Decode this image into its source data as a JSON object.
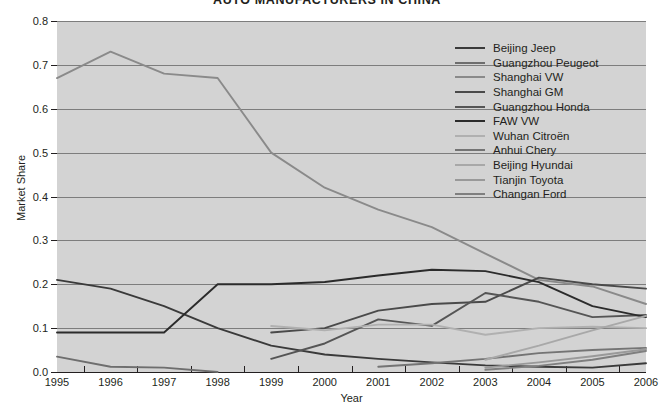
{
  "chart_data": {
    "type": "line",
    "title": "AUTO MANUFACTURERS IN CHINA",
    "xlabel": "Year",
    "ylabel": "Market Share",
    "x": [
      1995,
      1996,
      1997,
      1998,
      1999,
      2000,
      2001,
      2002,
      2003,
      2004,
      2005,
      2006
    ],
    "xtick_labels": [
      "1995",
      "1996",
      "1997",
      "1998",
      "1999",
      "2000",
      "2001",
      "2002",
      "2003",
      "2004",
      "2005",
      "2006"
    ],
    "ytick_labels": [
      "0.0",
      "0.1",
      "0.2",
      "0.3",
      "0.4",
      "0.5",
      "0.6",
      "0.7",
      "0.8"
    ],
    "ytick_values": [
      0.0,
      0.1,
      0.2,
      0.3,
      0.4,
      0.5,
      0.6,
      0.7,
      0.8
    ],
    "ylim": [
      0.0,
      0.8
    ],
    "xlim": [
      1995,
      2006
    ],
    "grid": true,
    "legend_position": "upper-right",
    "series": [
      {
        "name": "Beijing Jeep",
        "color": "#3a3a3a",
        "x": [
          1995,
          1996,
          1997,
          1998,
          1999,
          2000,
          2001,
          2002,
          2003,
          2004,
          2005,
          2006
        ],
        "values": [
          0.21,
          0.19,
          0.15,
          0.1,
          0.06,
          0.04,
          0.03,
          0.022,
          0.015,
          0.012,
          0.01,
          0.02
        ]
      },
      {
        "name": "Guangzhou Peugeot",
        "color": "#6e6e6e",
        "x": [
          1995,
          1996,
          1997,
          1998,
          1999
        ],
        "values": [
          0.035,
          0.012,
          0.01,
          0.0,
          null
        ]
      },
      {
        "name": "Shanghai VW",
        "color": "#8a8a8a",
        "x": [
          1995,
          1996,
          1997,
          1998,
          1999,
          2000,
          2001,
          2002,
          2003,
          2004,
          2005,
          2006
        ],
        "values": [
          0.67,
          0.73,
          0.68,
          0.67,
          0.5,
          0.42,
          0.37,
          0.33,
          0.27,
          0.21,
          0.195,
          0.155
        ]
      },
      {
        "name": "Shanghai GM",
        "color": "#4a4a4a",
        "x": [
          1999,
          2000,
          2001,
          2002,
          2003,
          2004,
          2005,
          2006
        ],
        "values": [
          0.09,
          0.1,
          0.14,
          0.155,
          0.16,
          0.215,
          0.2,
          0.19
        ]
      },
      {
        "name": "Guangzhou Honda",
        "color": "#555555",
        "x": [
          1999,
          2000,
          2001,
          2002,
          2003,
          2004,
          2005,
          2006
        ],
        "values": [
          0.03,
          0.065,
          0.12,
          0.105,
          0.18,
          0.16,
          0.125,
          0.13
        ]
      },
      {
        "name": "FAW VW",
        "color": "#2b2b2b",
        "x": [
          1995,
          1996,
          1997,
          1998,
          1999,
          2000,
          2001,
          2002,
          2003,
          2004,
          2005,
          2006
        ],
        "values": [
          0.09,
          0.09,
          0.09,
          0.2,
          0.2,
          0.205,
          0.22,
          0.233,
          0.23,
          0.205,
          0.15,
          0.125
        ]
      },
      {
        "name": "Wuhan Citroën",
        "color": "#b0b0b0",
        "x": [
          1999,
          2000,
          2001,
          2002,
          2003,
          2004,
          2005,
          2006
        ],
        "values": [
          0.105,
          0.095,
          0.108,
          0.108,
          0.085,
          0.1,
          0.103,
          0.1
        ]
      },
      {
        "name": "Anhui Chery",
        "color": "#747474",
        "x": [
          2001,
          2002,
          2003,
          2004,
          2005,
          2006
        ],
        "values": [
          0.012,
          0.02,
          0.03,
          0.043,
          0.05,
          0.055
        ]
      },
      {
        "name": "Beijing Hyundai",
        "color": "#a8a8a8",
        "x": [
          2003,
          2004,
          2005,
          2006
        ],
        "values": [
          0.028,
          0.06,
          0.095,
          0.128
        ]
      },
      {
        "name": "Tianjin Toyota",
        "color": "#999999",
        "x": [
          2003,
          2004,
          2005,
          2006
        ],
        "values": [
          0.01,
          0.022,
          0.036,
          0.052
        ]
      },
      {
        "name": "Changan Ford",
        "color": "#7f7f7f",
        "x": [
          2003,
          2004,
          2005,
          2006
        ],
        "values": [
          0.005,
          0.014,
          0.028,
          0.048
        ]
      }
    ]
  },
  "legend": {
    "items": [
      {
        "label": "Beijing Jeep",
        "color": "#3a3a3a"
      },
      {
        "label": "Guangzhou Peugeot",
        "color": "#6e6e6e"
      },
      {
        "label": "Shanghai VW",
        "color": "#8a8a8a"
      },
      {
        "label": "Shanghai GM",
        "color": "#4a4a4a"
      },
      {
        "label": "Guangzhou Honda",
        "color": "#555555"
      },
      {
        "label": "FAW VW",
        "color": "#2b2b2b"
      },
      {
        "label": "Wuhan Citroën",
        "color": "#b0b0b0"
      },
      {
        "label": "Anhui Chery",
        "color": "#747474"
      },
      {
        "label": "Beijing Hyundai",
        "color": "#a8a8a8"
      },
      {
        "label": "Tianjin Toyota",
        "color": "#999999"
      },
      {
        "label": "Changan Ford",
        "color": "#7f7f7f"
      }
    ]
  },
  "colors": {
    "plot_background": "#d3d3d3",
    "grid": "#7d7d7d",
    "axis": "#231f20",
    "page_background": "#ffffff"
  }
}
